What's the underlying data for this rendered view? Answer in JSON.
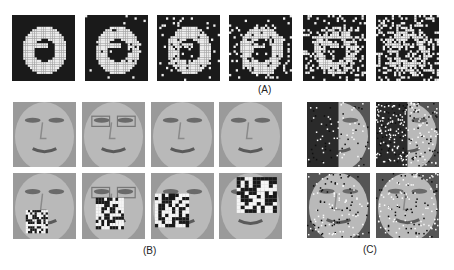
{
  "figure": {
    "panel_a": {
      "label": "(A)",
      "description": "Handwritten digit zero with increasing noise levels",
      "tiles": [
        {
          "noise": 0.0
        },
        {
          "noise": 0.05
        },
        {
          "noise": 0.12
        },
        {
          "noise": 0.25
        },
        {
          "noise": 0.4
        },
        {
          "noise": 0.6
        }
      ]
    },
    "panel_b": {
      "label": "(B)",
      "description": "Face images, clean (top row) and with random block occlusion (bottom row)",
      "faces": [
        "face-1",
        "face-2",
        "face-3",
        "face-4"
      ]
    },
    "panel_c": {
      "label": "(C)",
      "description": "Face images with salt-and-pepper pixel corruption"
    }
  }
}
